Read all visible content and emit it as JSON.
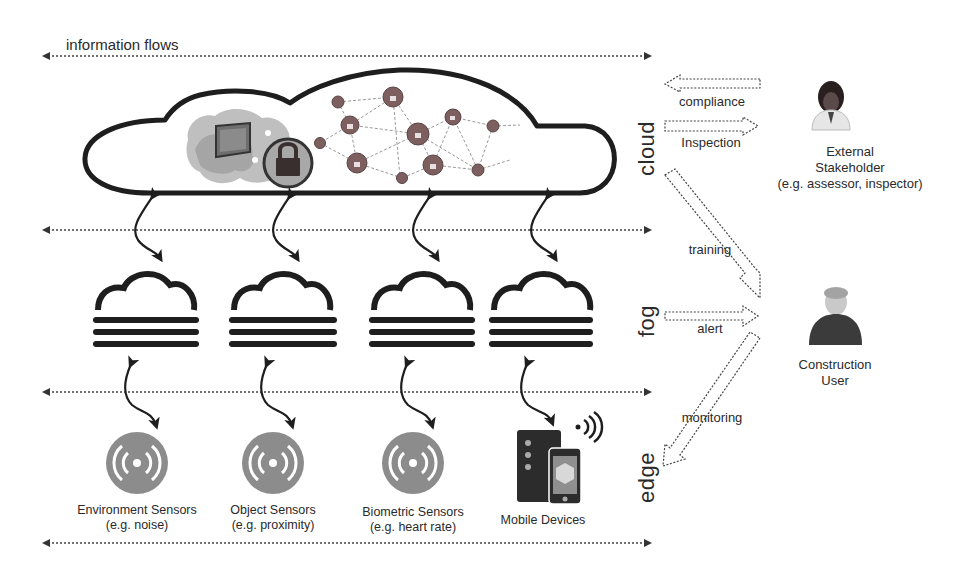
{
  "diagram": {
    "title": "information flows",
    "layers": [
      {
        "id": "cloud",
        "label": "cloud"
      },
      {
        "id": "fog",
        "label": "fog"
      },
      {
        "id": "edge",
        "label": "edge"
      }
    ],
    "cloud_contents": {
      "icons": [
        "secure-map-lock-icon",
        "encrypted-network-icon"
      ]
    },
    "fog_nodes": [
      {
        "icon": "fog-icon"
      },
      {
        "icon": "fog-icon"
      },
      {
        "icon": "fog-icon"
      },
      {
        "icon": "fog-icon"
      }
    ],
    "edge_devices": [
      {
        "name": "Environment Sensors",
        "example": "(e.g. noise)",
        "icon": "sensor-icon"
      },
      {
        "name": "Object Sensors",
        "example": "(e.g. proximity)",
        "icon": "sensor-icon"
      },
      {
        "name": "Biometric Sensors",
        "example": "(e.g. heart rate)",
        "icon": "sensor-icon"
      },
      {
        "name": "Mobile Devices",
        "example": "",
        "icon": "mobile-devices-icon"
      }
    ],
    "flows": {
      "compliance": "compliance",
      "inspection": "Inspection",
      "training": "training",
      "alert": "alert",
      "monitoring": "monitoring"
    },
    "actors": {
      "external": {
        "line1": "External",
        "line2": "Stakeholder",
        "line3": "(e.g. assessor, inspector)"
      },
      "construction": {
        "line1": "Construction",
        "line2": "User"
      }
    },
    "colors": {
      "stroke": "#1e1e1e",
      "sensor": "#8a8a8a",
      "lock": "#7d5f5f",
      "dotted": "#3a3a3a"
    }
  }
}
